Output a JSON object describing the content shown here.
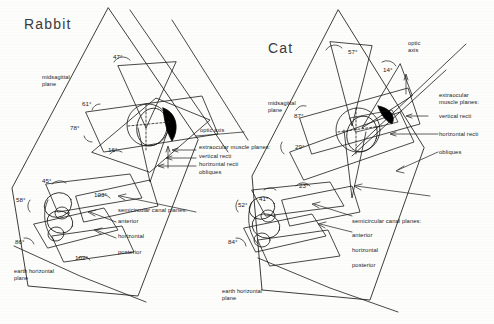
{
  "figure": {
    "caption_present": false,
    "panels": [
      {
        "id": "rabbit",
        "title": "Rabbit",
        "plane_labels": {
          "midsagittal": "midsagittal\nplane",
          "optic_axis": "optic axis",
          "earth_horizontal": "earth horizontal\nplane"
        },
        "muscle_legend": {
          "heading": "extraocular muscle planes:",
          "items": [
            "vertical recti",
            "horizontal recti",
            "obliques"
          ]
        },
        "canal_legend": {
          "heading": "semicircular canal planes:",
          "items": [
            "anterior",
            "horizontal",
            "posterior"
          ]
        },
        "angles": [
          "47°",
          "61°",
          "78°",
          "16°",
          "45°",
          "58°",
          "86°",
          "103°",
          "102°"
        ]
      },
      {
        "id": "cat",
        "title": "Cat",
        "plane_labels": {
          "midsagittal": "midsagittal\nplane",
          "optic_axis": "optic\naxis",
          "earth_horizontal": "earth horizontal\nplane"
        },
        "muscle_legend": {
          "heading": "extraocular\nmuscle planes:",
          "items": [
            "vertical recti",
            "horizontal recti",
            "obliques"
          ]
        },
        "canal_legend": {
          "heading": "semicircular canal planes:",
          "items": [
            "anterior",
            "horizontal",
            "posterior"
          ]
        },
        "angles": [
          "57°",
          "14°",
          "87°",
          "29°",
          "23°",
          "41°",
          "52°",
          "84°"
        ]
      }
    ],
    "colors": {
      "ink": "#1a1a1a",
      "paper": "#fdfdfb",
      "pupil": "#000000"
    }
  }
}
